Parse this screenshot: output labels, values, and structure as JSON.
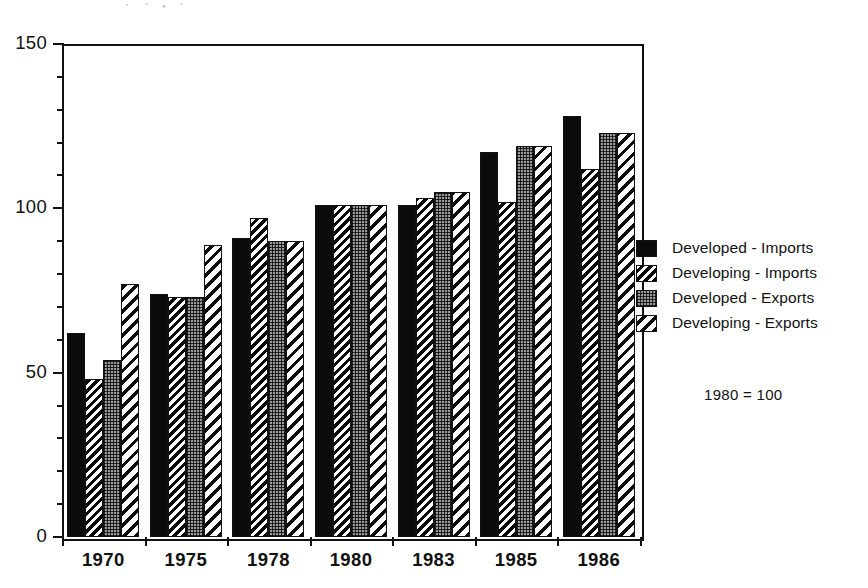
{
  "chart_data": {
    "type": "bar",
    "title": "",
    "subtitle": "",
    "xlabel": "",
    "ylabel": "",
    "categories": [
      "1970",
      "1975",
      "1978",
      "1980",
      "1983",
      "1985",
      "1986"
    ],
    "series": [
      {
        "name": "Developed - Imports",
        "pattern": "solid-black",
        "values": [
          62,
          74,
          91,
          101,
          101,
          117,
          128
        ]
      },
      {
        "name": "Developing - Imports",
        "pattern": "dense-diagonal-hatch",
        "values": [
          48,
          73,
          97,
          101,
          103,
          102,
          112
        ]
      },
      {
        "name": "Developed - Exports",
        "pattern": "gray-dotted",
        "values": [
          54,
          73,
          90,
          101,
          105,
          119,
          123
        ]
      },
      {
        "name": "Developing - Exports",
        "pattern": "wide-diagonal-hatch",
        "values": [
          77,
          89,
          90,
          101,
          105,
          119,
          123
        ]
      }
    ],
    "ylim": [
      0,
      150
    ],
    "y_major_ticks": [
      0,
      50,
      100,
      150
    ],
    "y_minor_tick_step": 10,
    "y_tick_labels": [
      "0",
      "50",
      "100",
      "150"
    ],
    "grid": false,
    "legend_position": "right",
    "annotations": [
      {
        "text": "1980 = 100",
        "position": "right-below-legend"
      }
    ]
  },
  "legend": {
    "items": [
      {
        "label": "Developed - Imports"
      },
      {
        "label": "Developing - Imports"
      },
      {
        "label": "Developed - Exports"
      },
      {
        "label": "Developing - Exports"
      }
    ]
  },
  "note": {
    "base_year_text": "1980 = 100"
  },
  "colors": {
    "ink": "#111111",
    "paper": "#ffffff",
    "dot_fill": "#9b9b9b"
  }
}
